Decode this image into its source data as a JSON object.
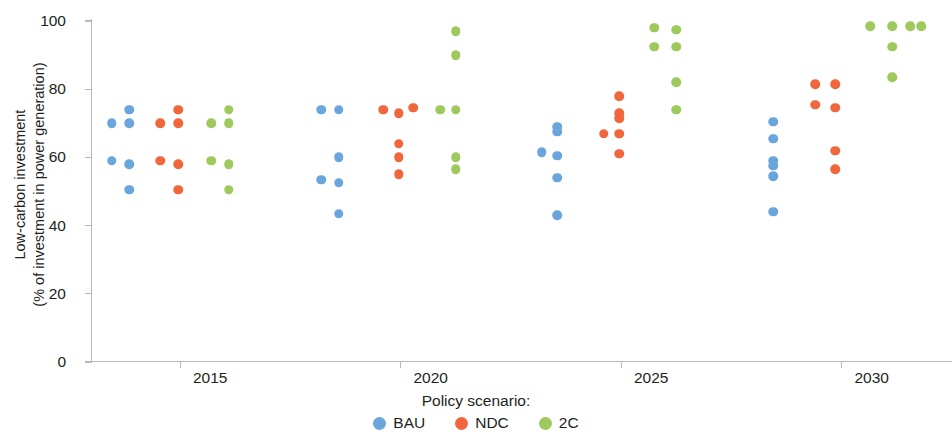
{
  "chart_data": {
    "type": "scatter",
    "title": "",
    "xlabel": "Policy scenario:",
    "ylabel_line1": "Low-carbon investment",
    "ylabel_line2": "(% of investment in power generation)",
    "ylim": [
      0,
      100
    ],
    "yticks": [
      0,
      20,
      40,
      60,
      80,
      100
    ],
    "ytick_labels": [
      "0",
      "20",
      "40",
      "60",
      "80",
      "100"
    ],
    "xtick_labels": [
      "2015",
      "2020",
      "2025",
      "2030"
    ],
    "xtick_positions": [
      2015,
      2020,
      2025,
      2030
    ],
    "xlim": [
      2013.0,
      2032.5
    ],
    "grid": false,
    "legend_position": "bottom-center",
    "legend_title": "Policy scenario:",
    "series": [
      {
        "name": "BAU",
        "color": "#6aa5db",
        "points": [
          {
            "x": 2013.45,
            "y": 70.0
          },
          {
            "x": 2013.85,
            "y": 74.0
          },
          {
            "x": 2013.85,
            "y": 70.0
          },
          {
            "x": 2013.45,
            "y": 59.0
          },
          {
            "x": 2013.85,
            "y": 58.0
          },
          {
            "x": 2013.85,
            "y": 50.5
          },
          {
            "x": 2018.2,
            "y": 74.0
          },
          {
            "x": 2018.6,
            "y": 74.0
          },
          {
            "x": 2018.6,
            "y": 60.0
          },
          {
            "x": 2018.2,
            "y": 53.5
          },
          {
            "x": 2018.6,
            "y": 52.5
          },
          {
            "x": 2018.6,
            "y": 43.5
          },
          {
            "x": 2023.55,
            "y": 69.0
          },
          {
            "x": 2023.55,
            "y": 67.5
          },
          {
            "x": 2023.2,
            "y": 61.5
          },
          {
            "x": 2023.55,
            "y": 60.5
          },
          {
            "x": 2023.55,
            "y": 54.0
          },
          {
            "x": 2023.55,
            "y": 43.0
          },
          {
            "x": 2028.45,
            "y": 70.5
          },
          {
            "x": 2028.45,
            "y": 65.5
          },
          {
            "x": 2028.45,
            "y": 59.0
          },
          {
            "x": 2028.45,
            "y": 57.5
          },
          {
            "x": 2028.45,
            "y": 54.5
          },
          {
            "x": 2028.45,
            "y": 44.0
          }
        ]
      },
      {
        "name": "NDC",
        "color": "#f0673d",
        "points": [
          {
            "x": 2014.55,
            "y": 70.0
          },
          {
            "x": 2014.95,
            "y": 74.0
          },
          {
            "x": 2014.95,
            "y": 70.0
          },
          {
            "x": 2014.55,
            "y": 59.0
          },
          {
            "x": 2014.95,
            "y": 58.0
          },
          {
            "x": 2014.95,
            "y": 50.5
          },
          {
            "x": 2019.6,
            "y": 74.0
          },
          {
            "x": 2019.95,
            "y": 73.0
          },
          {
            "x": 2020.28,
            "y": 74.5
          },
          {
            "x": 2019.95,
            "y": 64.0
          },
          {
            "x": 2019.95,
            "y": 60.0
          },
          {
            "x": 2019.95,
            "y": 55.0
          },
          {
            "x": 2024.95,
            "y": 78.0
          },
          {
            "x": 2024.95,
            "y": 73.0
          },
          {
            "x": 2024.95,
            "y": 71.5
          },
          {
            "x": 2024.6,
            "y": 67.0
          },
          {
            "x": 2024.95,
            "y": 67.0
          },
          {
            "x": 2024.95,
            "y": 61.0
          },
          {
            "x": 2029.4,
            "y": 81.5
          },
          {
            "x": 2029.85,
            "y": 81.5
          },
          {
            "x": 2029.4,
            "y": 75.5
          },
          {
            "x": 2029.85,
            "y": 74.5
          },
          {
            "x": 2029.85,
            "y": 62.0
          },
          {
            "x": 2029.85,
            "y": 56.5
          }
        ]
      },
      {
        "name": "2C",
        "color": "#9ec95d",
        "points": [
          {
            "x": 2015.7,
            "y": 70.0
          },
          {
            "x": 2016.1,
            "y": 74.0
          },
          {
            "x": 2016.1,
            "y": 70.0
          },
          {
            "x": 2015.7,
            "y": 59.0
          },
          {
            "x": 2016.1,
            "y": 58.0
          },
          {
            "x": 2016.1,
            "y": 50.5
          },
          {
            "x": 2021.25,
            "y": 97.0
          },
          {
            "x": 2021.25,
            "y": 90.0
          },
          {
            "x": 2020.9,
            "y": 74.0
          },
          {
            "x": 2021.25,
            "y": 74.0
          },
          {
            "x": 2021.25,
            "y": 60.0
          },
          {
            "x": 2021.25,
            "y": 56.5
          },
          {
            "x": 2025.75,
            "y": 98.0
          },
          {
            "x": 2026.25,
            "y": 97.5
          },
          {
            "x": 2025.75,
            "y": 92.5
          },
          {
            "x": 2026.25,
            "y": 92.5
          },
          {
            "x": 2026.25,
            "y": 82.0
          },
          {
            "x": 2026.25,
            "y": 74.0
          },
          {
            "x": 2030.65,
            "y": 98.5
          },
          {
            "x": 2031.15,
            "y": 98.5
          },
          {
            "x": 2031.55,
            "y": 98.5
          },
          {
            "x": 2031.8,
            "y": 98.5
          },
          {
            "x": 2031.15,
            "y": 92.5
          },
          {
            "x": 2031.15,
            "y": 83.5
          }
        ]
      }
    ]
  },
  "axes": {
    "ylabel_line1": "Low-carbon investment",
    "ylabel_line2": "(% of investment in power generation)",
    "yticks": [
      "100",
      "80",
      "60",
      "40",
      "20",
      "0"
    ],
    "xticks": [
      "2015",
      "2020",
      "2025",
      "2030"
    ]
  },
  "legend": {
    "title": "Policy scenario:",
    "items": [
      {
        "label": "BAU",
        "color": "#6aa5db"
      },
      {
        "label": "NDC",
        "color": "#f0673d"
      },
      {
        "label": "2C",
        "color": "#9ec95d"
      }
    ]
  }
}
